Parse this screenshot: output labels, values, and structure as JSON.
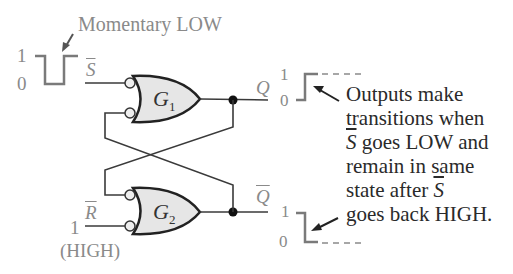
{
  "diagram": {
    "title_annotation": "Momentary LOW",
    "input_s": {
      "label": "S",
      "overbar": true,
      "high_level": "1",
      "low_level": "0"
    },
    "input_r": {
      "label": "R",
      "overbar": true,
      "level": "1",
      "state_note": "(HIGH)"
    },
    "gates": [
      {
        "name": "G",
        "subscript": "1",
        "type": "negative-OR (NAND)"
      },
      {
        "name": "G",
        "subscript": "2",
        "type": "negative-OR (NAND)"
      }
    ],
    "output_q": {
      "label": "Q",
      "overbar": false,
      "high_level": "1",
      "low_level": "0",
      "transition": "LOW to HIGH"
    },
    "output_qbar": {
      "label": "Q",
      "overbar": true,
      "high_level": "1",
      "low_level": "0",
      "transition": "HIGH to LOW"
    },
    "note_lines": [
      "Outputs make",
      "transitions when",
      "goes LOW and",
      "remain in same",
      "state after",
      "goes back HIGH."
    ],
    "note_inline_symbol": "S",
    "colors": {
      "line": "#3a3a3a",
      "gate_fill": "#e6e6e6",
      "label_gray": "#8a8a8a",
      "text_dark": "#2a2a2a",
      "waveform": "#7a7a7a"
    }
  }
}
